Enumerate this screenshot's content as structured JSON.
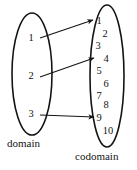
{
  "figure": {
    "kind": "function-mapping-diagram",
    "stroke_color": "#141414",
    "text_color": "#141414",
    "background_color": "#ffffff"
  },
  "domain": {
    "label": "domain",
    "elements": [
      {
        "value": "1",
        "x": 31,
        "y": 38
      },
      {
        "value": "2",
        "x": 31,
        "y": 76
      },
      {
        "value": "3",
        "x": 31,
        "y": 114
      }
    ],
    "ellipse": {
      "cx": 32,
      "cy": 74,
      "rx": 20,
      "ry": 61
    }
  },
  "codomain": {
    "label": "codomain",
    "elements": [
      {
        "value": "1",
        "x": 99,
        "y": 21
      },
      {
        "value": "2",
        "x": 105,
        "y": 34
      },
      {
        "value": "3",
        "x": 98,
        "y": 46
      },
      {
        "value": "4",
        "x": 106,
        "y": 59
      },
      {
        "value": "5",
        "x": 99,
        "y": 71
      },
      {
        "value": "6",
        "x": 106,
        "y": 84
      },
      {
        "value": "7",
        "x": 99,
        "y": 96
      },
      {
        "value": "8",
        "x": 106,
        "y": 105
      },
      {
        "value": "9",
        "x": 99,
        "y": 118
      },
      {
        "value": "10",
        "x": 108,
        "y": 131
      }
    ],
    "ellipse": {
      "cx": 107,
      "cy": 76,
      "rx": 17,
      "ry": 71
    }
  },
  "arrows": [
    {
      "from": "1",
      "to": "1",
      "x1": 40,
      "y1": 38,
      "x2": 93,
      "y2": 20
    },
    {
      "from": "2",
      "to": "4",
      "x1": 40,
      "y1": 77,
      "x2": 94,
      "y2": 58
    },
    {
      "from": "3",
      "to": "9",
      "x1": 40,
      "y1": 115,
      "x2": 94,
      "y2": 117
    }
  ]
}
